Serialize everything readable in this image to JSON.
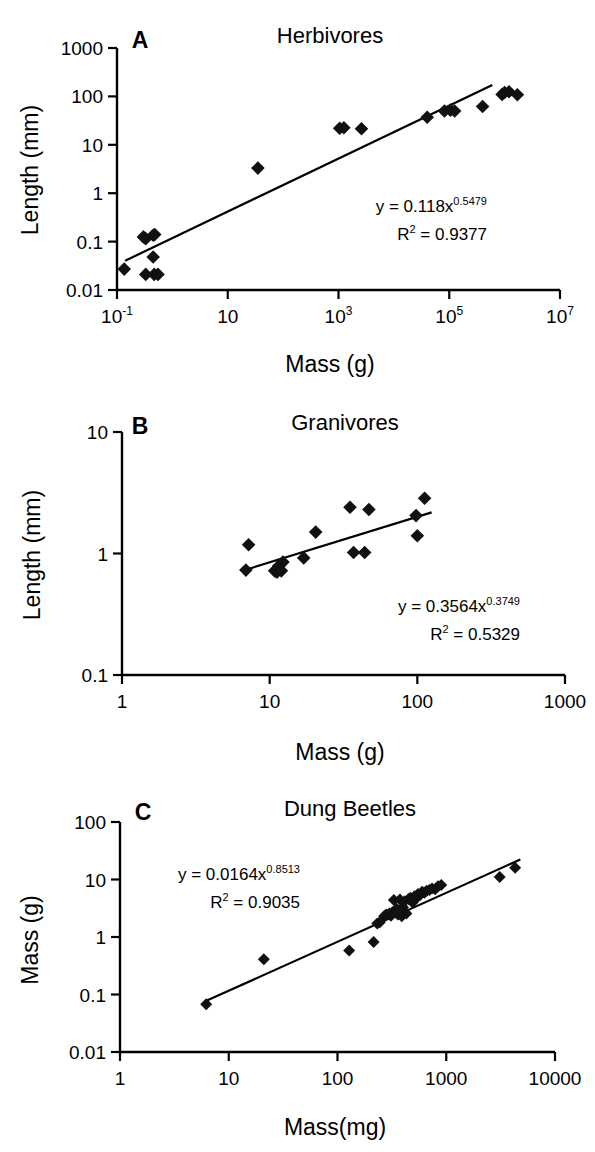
{
  "figure": {
    "panels": [
      "A",
      "B",
      "C"
    ]
  },
  "chart_data": [
    {
      "type": "scatter",
      "panel_letter": "A",
      "title": "Herbivores",
      "xlabel": "Mass (g)",
      "ylabel": "Length (mm)",
      "xscale": "log",
      "yscale": "log",
      "xlim": [
        0.1,
        10000000
      ],
      "ylim": [
        0.01,
        1000
      ],
      "xticks": [
        0.1,
        10,
        1000,
        100000,
        10000000
      ],
      "xticklabels": [
        "10-1",
        "10",
        "103",
        "105",
        "107"
      ],
      "xtick_display": [
        {
          "base": "10",
          "sup": "-1"
        },
        {
          "base": "10",
          "sup": ""
        },
        {
          "base": "10",
          "sup": "3"
        },
        {
          "base": "10",
          "sup": "5"
        },
        {
          "base": "10",
          "sup": "7"
        }
      ],
      "yticks": [
        0.01,
        0.1,
        1,
        10,
        100,
        1000
      ],
      "yticklabels": [
        "0.01",
        "0.1",
        "1",
        "10",
        "100",
        "1000"
      ],
      "grid": false,
      "legend": "none",
      "equation_label": "y = 0.118x",
      "equation_exponent": "0.5479",
      "r2_label": "R",
      "r2_sup": "2",
      "r2_value": "= 0.9377",
      "fit": {
        "coefficient": 0.118,
        "exponent": 0.5479,
        "r2": 0.9377
      },
      "fit_line_x": [
        0.14,
        600000
      ],
      "points": [
        {
          "x": 0.135,
          "y": 0.027
        },
        {
          "x": 0.3,
          "y": 0.125
        },
        {
          "x": 0.33,
          "y": 0.115
        },
        {
          "x": 0.45,
          "y": 0.135
        },
        {
          "x": 0.48,
          "y": 0.14
        },
        {
          "x": 0.45,
          "y": 0.048
        },
        {
          "x": 0.33,
          "y": 0.021
        },
        {
          "x": 0.47,
          "y": 0.021
        },
        {
          "x": 0.55,
          "y": 0.021
        },
        {
          "x": 35.0,
          "y": 3.3
        },
        {
          "x": 1050.0,
          "y": 22.0
        },
        {
          "x": 1250.0,
          "y": 22.5
        },
        {
          "x": 2600.0,
          "y": 21.5
        },
        {
          "x": 40000.0,
          "y": 37.0
        },
        {
          "x": 82000.0,
          "y": 50.0
        },
        {
          "x": 105000.0,
          "y": 52.0
        },
        {
          "x": 125000.0,
          "y": 50.0
        },
        {
          "x": 400000.0,
          "y": 62.0
        },
        {
          "x": 900000.0,
          "y": 110.0
        },
        {
          "x": 1000000.0,
          "y": 120.0
        },
        {
          "x": 1200000.0,
          "y": 125.0
        },
        {
          "x": 1700000.0,
          "y": 108.0
        }
      ]
    },
    {
      "type": "scatter",
      "panel_letter": "B",
      "title": "Granivores",
      "xlabel": "Mass (g)",
      "ylabel": "Length (mm)",
      "xscale": "log",
      "yscale": "log",
      "xlim": [
        1,
        1000
      ],
      "ylim": [
        0.1,
        10
      ],
      "xticks": [
        1,
        10,
        100,
        1000
      ],
      "xticklabels": [
        "1",
        "10",
        "100",
        "1000"
      ],
      "yticks": [
        0.1,
        1,
        10
      ],
      "yticklabels": [
        "0.1",
        "1",
        "10"
      ],
      "grid": false,
      "legend": "none",
      "equation_label": "y = 0.3564x",
      "equation_exponent": "0.3749",
      "r2_label": "R",
      "r2_sup": "2",
      "r2_value": "= 0.5329",
      "fit": {
        "coefficient": 0.3564,
        "exponent": 0.3749,
        "r2": 0.5329
      },
      "fit_line_x": [
        6.8,
        125
      ],
      "points": [
        {
          "x": 6.9,
          "y": 0.73
        },
        {
          "x": 7.2,
          "y": 1.18
        },
        {
          "x": 10.8,
          "y": 0.72
        },
        {
          "x": 11.2,
          "y": 0.7
        },
        {
          "x": 11.5,
          "y": 0.79
        },
        {
          "x": 12.0,
          "y": 0.72
        },
        {
          "x": 12.3,
          "y": 0.85
        },
        {
          "x": 17.0,
          "y": 0.92
        },
        {
          "x": 20.5,
          "y": 1.5
        },
        {
          "x": 35.0,
          "y": 2.4
        },
        {
          "x": 37.0,
          "y": 1.02
        },
        {
          "x": 44.0,
          "y": 1.02
        },
        {
          "x": 47.0,
          "y": 2.3
        },
        {
          "x": 98.0,
          "y": 2.05
        },
        {
          "x": 100.0,
          "y": 1.4
        },
        {
          "x": 112.0,
          "y": 2.85
        }
      ]
    },
    {
      "type": "scatter",
      "panel_letter": "C",
      "title": "Dung Beetles",
      "xlabel": "Mass(mg)",
      "ylabel": "Mass (g)",
      "xscale": "log",
      "yscale": "log",
      "xlim": [
        1,
        10000
      ],
      "ylim": [
        0.01,
        100
      ],
      "xticks": [
        1,
        10,
        100,
        1000,
        10000
      ],
      "xticklabels": [
        "1",
        "10",
        "100",
        "1000",
        "10000"
      ],
      "yticks": [
        0.01,
        0.1,
        1,
        10,
        100
      ],
      "yticklabels": [
        "0.01",
        "0.1",
        "1",
        "10",
        "100"
      ],
      "grid": false,
      "legend": "none",
      "equation_label": "y = 0.0164x",
      "equation_exponent": "0.8513",
      "r2_label": "R",
      "r2_sup": "2",
      "r2_value": "= 0.9035",
      "fit": {
        "coefficient": 0.0164,
        "exponent": 0.8513,
        "r2": 0.9035
      },
      "fit_line_x": [
        6.0,
        4800
      ],
      "points": [
        {
          "x": 6.2,
          "y": 0.068
        },
        {
          "x": 21.0,
          "y": 0.41
        },
        {
          "x": 128.0,
          "y": 0.58
        },
        {
          "x": 215.0,
          "y": 0.82
        },
        {
          "x": 232.0,
          "y": 1.72
        },
        {
          "x": 245.0,
          "y": 1.8
        },
        {
          "x": 268.0,
          "y": 2.3
        },
        {
          "x": 280.0,
          "y": 2.45
        },
        {
          "x": 300.0,
          "y": 2.55
        },
        {
          "x": 310.0,
          "y": 2.35
        },
        {
          "x": 320.0,
          "y": 2.7
        },
        {
          "x": 330.0,
          "y": 4.4
        },
        {
          "x": 345.0,
          "y": 2.65
        },
        {
          "x": 350.0,
          "y": 3.1
        },
        {
          "x": 360.0,
          "y": 2.45
        },
        {
          "x": 375.0,
          "y": 4.5
        },
        {
          "x": 390.0,
          "y": 2.3
        },
        {
          "x": 400.0,
          "y": 3.3
        },
        {
          "x": 415.0,
          "y": 4.2
        },
        {
          "x": 430.0,
          "y": 2.55
        },
        {
          "x": 450.0,
          "y": 4.6
        },
        {
          "x": 470.0,
          "y": 4.8
        },
        {
          "x": 490.0,
          "y": 4.0
        },
        {
          "x": 510.0,
          "y": 5.1
        },
        {
          "x": 530.0,
          "y": 4.7
        },
        {
          "x": 550.0,
          "y": 5.6
        },
        {
          "x": 575.0,
          "y": 5.4
        },
        {
          "x": 600.0,
          "y": 6.1
        },
        {
          "x": 630.0,
          "y": 5.9
        },
        {
          "x": 660.0,
          "y": 6.4
        },
        {
          "x": 700.0,
          "y": 6.6
        },
        {
          "x": 740.0,
          "y": 7.0
        },
        {
          "x": 790.0,
          "y": 6.8
        },
        {
          "x": 840.0,
          "y": 7.6
        },
        {
          "x": 900.0,
          "y": 8.0
        },
        {
          "x": 3100.0,
          "y": 11.0
        },
        {
          "x": 4300.0,
          "y": 16.0
        }
      ]
    }
  ]
}
